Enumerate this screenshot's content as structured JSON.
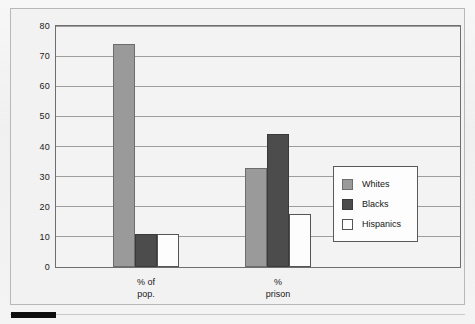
{
  "chart_data": {
    "type": "bar",
    "title": "",
    "subtitle": "",
    "xlabel": "",
    "ylabel": "",
    "ylim": [
      0,
      80
    ],
    "ytick_step": 10,
    "yticks": [
      "80",
      "70",
      "60",
      "50",
      "40",
      "30",
      "20",
      "10",
      "0"
    ],
    "grid": true,
    "legend_position": "inside-right",
    "categories": [
      "% of pop.",
      "% prison"
    ],
    "category_lines": [
      [
        "% of",
        "pop."
      ],
      [
        "%",
        "prison"
      ]
    ],
    "series": [
      {
        "name": "Whites",
        "values": [
          74,
          33
        ],
        "color": "#9a9a9a"
      },
      {
        "name": "Blacks",
        "values": [
          11,
          44
        ],
        "color": "#4c4c4c"
      },
      {
        "name": "Hispanics",
        "values": [
          11,
          17.5
        ],
        "color": "#ffffff"
      }
    ]
  },
  "legend": {
    "items": [
      {
        "label": "Whites",
        "swatch": "whites"
      },
      {
        "label": "Blacks",
        "swatch": "blacks"
      },
      {
        "label": "Hispanics",
        "swatch": "hispanics"
      }
    ]
  },
  "colors": {
    "whites": "#9a9a9a",
    "blacks": "#4c4c4c",
    "hispanics": "#ffffff",
    "axis": "#6e6e6e",
    "gridline": "#8d8d8d",
    "page_background": "#efefef",
    "plot_background": "#f3f3f3"
  }
}
